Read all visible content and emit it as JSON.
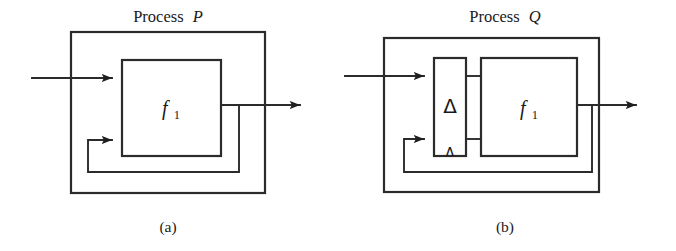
{
  "figure": {
    "background_color": "#ffffff",
    "line_color": "#2b2b2b",
    "text_color": "#1a1a1a"
  },
  "panels": [
    {
      "id": "panel-a",
      "caption": "(a)",
      "title_prefix": "Process",
      "title_symbol": "P",
      "blocks": [
        {
          "name": "function-block",
          "label_base": "f",
          "label_sub": "1"
        }
      ],
      "outer_box_label": "Process P",
      "signals": {
        "input_arrow": "input",
        "output_arrow": "output",
        "feedback_arrow": "feedback"
      }
    },
    {
      "id": "panel-b",
      "caption": "(b)",
      "title_prefix": "Process",
      "title_symbol": "Q",
      "blocks": [
        {
          "name": "delay-block",
          "label_base": "Δ",
          "label_sub": ""
        },
        {
          "name": "function-block",
          "label_base": "f",
          "label_sub": "1"
        }
      ],
      "outer_box_label": "Process Q",
      "delay_small_glyph": "Δ",
      "signals": {
        "input_arrow": "input",
        "output_arrow": "output",
        "feedback_arrow": "feedback"
      }
    }
  ]
}
